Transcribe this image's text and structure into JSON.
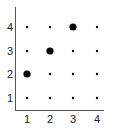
{
  "chart_data": {
    "type": "scatter",
    "title": "",
    "xlabel": "",
    "ylabel": "",
    "xlim": [
      0.5,
      4.5
    ],
    "ylim": [
      0.5,
      4.5
    ],
    "grid": false,
    "x_ticks": [
      "1",
      "2",
      "3",
      "4"
    ],
    "y_ticks": [
      "1",
      "2",
      "3",
      "4"
    ],
    "series": [
      {
        "name": "grid points",
        "marker_size": "small",
        "points": [
          {
            "x": 1,
            "y": 1
          },
          {
            "x": 2,
            "y": 1
          },
          {
            "x": 3,
            "y": 1
          },
          {
            "x": 4,
            "y": 1
          },
          {
            "x": 2,
            "y": 2
          },
          {
            "x": 3,
            "y": 2
          },
          {
            "x": 4,
            "y": 2
          },
          {
            "x": 1,
            "y": 3
          },
          {
            "x": 3,
            "y": 3
          },
          {
            "x": 4,
            "y": 3
          },
          {
            "x": 1,
            "y": 4
          },
          {
            "x": 2,
            "y": 4
          },
          {
            "x": 4,
            "y": 4
          }
        ]
      },
      {
        "name": "highlighted points",
        "marker_size": "large",
        "points": [
          {
            "x": 1,
            "y": 2
          },
          {
            "x": 2,
            "y": 3
          },
          {
            "x": 3,
            "y": 4
          }
        ]
      }
    ]
  },
  "colors": {
    "axis": "#555555",
    "marker": "#000000",
    "text": "#222222"
  }
}
